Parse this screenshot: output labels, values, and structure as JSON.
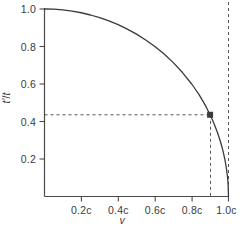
{
  "chart_data": {
    "type": "line",
    "title": "",
    "xlabel": "v",
    "ylabel": "t'/t",
    "xlim": [
      0,
      1.0
    ],
    "ylim": [
      0,
      1.0
    ],
    "grid": false,
    "legend": "none",
    "x_tick_labels": [
      "0.2c",
      "0.4c",
      "0.6c",
      "0.8c",
      "1.0c"
    ],
    "x_tick_values": [
      0.2,
      0.4,
      0.6,
      0.8,
      1.0
    ],
    "y_tick_labels": [
      "0.2",
      "0.4",
      "0.6",
      "0.8",
      "1.0"
    ],
    "y_tick_values": [
      0.2,
      0.4,
      0.6,
      0.8,
      1.0
    ],
    "series": [
      {
        "name": "t'/t = sqrt(1 - v^2/c^2)",
        "style": "solid",
        "color": "#3a3a3a",
        "x": [
          0.0,
          0.05,
          0.1,
          0.15,
          0.2,
          0.25,
          0.3,
          0.35,
          0.4,
          0.45,
          0.5,
          0.55,
          0.6,
          0.65,
          0.7,
          0.75,
          0.8,
          0.82,
          0.84,
          0.86,
          0.88,
          0.9,
          0.92,
          0.94,
          0.95,
          0.96,
          0.97,
          0.98,
          0.985,
          0.99,
          0.995,
          0.998,
          1.0
        ],
        "y": [
          1.0,
          0.999,
          0.995,
          0.989,
          0.98,
          0.968,
          0.954,
          0.937,
          0.917,
          0.893,
          0.866,
          0.835,
          0.8,
          0.76,
          0.714,
          0.661,
          0.6,
          0.572,
          0.543,
          0.51,
          0.475,
          0.436,
          0.392,
          0.341,
          0.312,
          0.28,
          0.243,
          0.199,
          0.172,
          0.141,
          0.1,
          0.063,
          0.0
        ]
      }
    ],
    "annotations": [
      {
        "name": "marked-point",
        "marker": "square",
        "x": 0.9,
        "y": 0.436,
        "guide_lines": "dashed",
        "color": "#3a3a3a"
      },
      {
        "name": "light-speed-asymptote",
        "x": 1.0,
        "style": "dashed",
        "color": "#555555"
      }
    ]
  },
  "axis_titles": {
    "x": "v",
    "y_numerator": "t′",
    "y_separator": "/",
    "y_denominator": "t"
  },
  "colors": {
    "curve": "#3a3a3a",
    "axis": "#4a4a4a",
    "dashed": "#555555",
    "marker": "#2a2a2a",
    "background": "#ffffff"
  }
}
